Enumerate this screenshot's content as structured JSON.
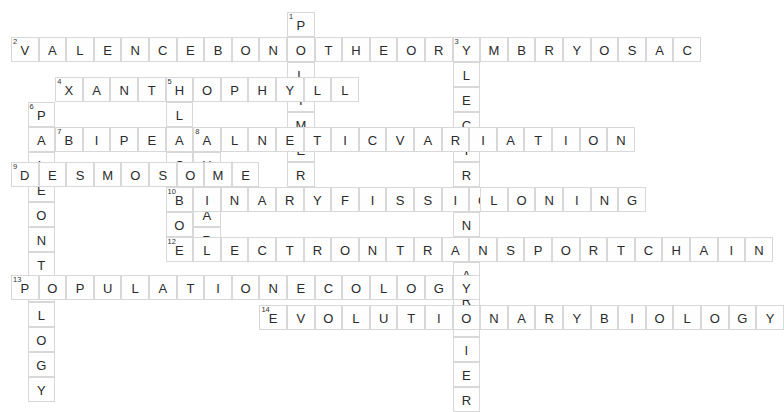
{
  "puzzle": {
    "title": "Biology Crossword Puzzle",
    "cell_size": 27.6,
    "row_height": 25.0,
    "origin_x": 11,
    "origin_y": 12,
    "colors": {
      "cell_background": "#fefefe",
      "cell_border": "#d8d8d8",
      "letter_color": "#2b2b2b",
      "number_color": "#333333",
      "page_background": "#ffffff"
    },
    "entries": [
      {
        "number": "1",
        "answer": "POLYMER",
        "direction": "down",
        "col": 10,
        "row": 0
      },
      {
        "number": "2",
        "answer": "VALENCEBONDTHEORY",
        "direction": "across",
        "col": 0,
        "row": 1
      },
      {
        "number": "3",
        "answer": "EMBRYOSAC",
        "direction": "across",
        "col": 16,
        "row": 1
      },
      {
        "number": "3",
        "answer": "ELECTRONCARRIER",
        "direction": "down",
        "col": 16,
        "row": 1
      },
      {
        "number": "4",
        "answer": "XANTHOPHYLL",
        "direction": "across",
        "col": 1.6,
        "row": 2.6
      },
      {
        "number": "5",
        "answer": "PLACEBO",
        "direction": "down",
        "col": 5.6,
        "row": 2.6
      },
      {
        "number": "6",
        "answer": "PALEONTOLOGY",
        "direction": "down",
        "col": 0.6,
        "row": 3.6
      },
      {
        "number": "7",
        "answer": "BIPEDAL",
        "direction": "across",
        "col": 1.6,
        "row": 4.6
      },
      {
        "number": "8",
        "answer": "GENETICVARIATION",
        "direction": "across",
        "col": 6.6,
        "row": 4.6
      },
      {
        "number": "8",
        "answer": "GULAR",
        "direction": "down",
        "col": 6.6,
        "row": 4.6
      },
      {
        "number": "9",
        "answer": "DESMOSOME",
        "direction": "across",
        "col": 0,
        "row": 6
      },
      {
        "number": "10",
        "answer": "BINARYFISSION",
        "direction": "across",
        "col": 5.6,
        "row": 7
      },
      {
        "number": "10",
        "answer": "BO",
        "direction": "down",
        "col": 5.6,
        "row": 7
      },
      {
        "number": "11",
        "answer": "CLONING",
        "direction": "across",
        "col": 16,
        "row": 7
      },
      {
        "number": "12",
        "answer": "ELECTRONTRANSPORTCHAIN",
        "direction": "across",
        "col": 5.6,
        "row": 9
      },
      {
        "number": "13",
        "answer": "POPULATIONECOLOGY",
        "direction": "across",
        "col": 0,
        "row": 10.5
      },
      {
        "number": "14",
        "answer": "EVOLUTIONARYBIOLOGY",
        "direction": "across",
        "col": 9,
        "row": 11.7
      }
    ],
    "cells": [
      {
        "x": 287,
        "y": 13,
        "letter": "P",
        "num": "1"
      },
      {
        "x": 287,
        "y": 38,
        "letter": "O",
        "num": ""
      },
      {
        "x": 287,
        "y": 63,
        "letter": "L",
        "num": ""
      },
      {
        "x": 287,
        "y": 88,
        "letter": "Y",
        "num": ""
      },
      {
        "x": 287,
        "y": 113,
        "letter": "M",
        "num": ""
      },
      {
        "x": 287,
        "y": 138,
        "letter": "E",
        "num": ""
      },
      {
        "x": 287,
        "y": 163,
        "letter": "R",
        "num": ""
      },
      {
        "x": 11,
        "y": 34,
        "letter": "V",
        "num": "2"
      },
      {
        "x": 38,
        "y": 34,
        "letter": "A",
        "num": ""
      },
      {
        "x": 65,
        "y": 34,
        "letter": "L",
        "num": ""
      },
      {
        "x": 92,
        "y": 34,
        "letter": "E",
        "num": ""
      },
      {
        "x": 119,
        "y": 34,
        "letter": "N",
        "num": ""
      },
      {
        "x": 146,
        "y": 34,
        "letter": "C",
        "num": ""
      },
      {
        "x": 173,
        "y": 34,
        "letter": "E",
        "num": ""
      },
      {
        "x": 200,
        "y": 34,
        "letter": "B",
        "num": ""
      },
      {
        "x": 227,
        "y": 34,
        "letter": "O",
        "num": ""
      },
      {
        "x": 254,
        "y": 34,
        "letter": "N",
        "num": ""
      },
      {
        "x": 281,
        "y": 34,
        "letter": "D",
        "num": ""
      },
      {
        "x": 308,
        "y": 34,
        "letter": "T",
        "num": ""
      },
      {
        "x": 335,
        "y": 34,
        "letter": "H",
        "num": ""
      },
      {
        "x": 362,
        "y": 34,
        "letter": "E",
        "num": ""
      },
      {
        "x": 389,
        "y": 34,
        "letter": "O",
        "num": ""
      },
      {
        "x": 416,
        "y": 34,
        "letter": "R",
        "num": ""
      },
      {
        "x": 443,
        "y": 34,
        "letter": "Y",
        "num": ""
      },
      {
        "x": 455,
        "y": 30,
        "letter": "E",
        "num": "3"
      },
      {
        "x": 482,
        "y": 30,
        "letter": "M",
        "num": ""
      },
      {
        "x": 509,
        "y": 30,
        "letter": "B",
        "num": ""
      },
      {
        "x": 536,
        "y": 30,
        "letter": "R",
        "num": ""
      },
      {
        "x": 563,
        "y": 30,
        "letter": "Y",
        "num": ""
      },
      {
        "x": 590,
        "y": 30,
        "letter": "O",
        "num": ""
      },
      {
        "x": 617,
        "y": 30,
        "letter": "S",
        "num": ""
      },
      {
        "x": 644,
        "y": 30,
        "letter": "A",
        "num": ""
      },
      {
        "x": 671,
        "y": 30,
        "letter": "C",
        "num": ""
      },
      {
        "x": 455,
        "y": 55,
        "letter": "L",
        "num": ""
      },
      {
        "x": 455,
        "y": 79,
        "letter": "E",
        "num": ""
      },
      {
        "x": 455,
        "y": 103,
        "letter": "C",
        "num": ""
      },
      {
        "x": 455,
        "y": 127,
        "letter": "T",
        "num": ""
      },
      {
        "x": 455,
        "y": 151,
        "letter": "R",
        "num": ""
      },
      {
        "x": 455,
        "y": 175,
        "letter": "O",
        "num": ""
      },
      {
        "x": 455,
        "y": 199,
        "letter": "N",
        "num": ""
      },
      {
        "x": 455,
        "y": 223,
        "letter": "C",
        "num": "11"
      },
      {
        "x": 455,
        "y": 247,
        "letter": "A",
        "num": ""
      },
      {
        "x": 455,
        "y": 271,
        "letter": "R",
        "num": ""
      },
      {
        "x": 455,
        "y": 295,
        "letter": "R",
        "num": ""
      },
      {
        "x": 455,
        "y": 319,
        "letter": "I",
        "num": ""
      },
      {
        "x": 455,
        "y": 343,
        "letter": "E",
        "num": ""
      },
      {
        "x": 455,
        "y": 367,
        "letter": "R",
        "num": ""
      },
      {
        "x": 55,
        "y": 70,
        "letter": "X",
        "num": "4"
      },
      {
        "x": 82,
        "y": 70,
        "letter": "A",
        "num": ""
      },
      {
        "x": 109,
        "y": 70,
        "letter": "N",
        "num": ""
      },
      {
        "x": 136,
        "y": 70,
        "letter": "T",
        "num": ""
      },
      {
        "x": 163,
        "y": 70,
        "letter": "H",
        "num": ""
      },
      {
        "x": 190,
        "y": 70,
        "letter": "O",
        "num": ""
      },
      {
        "x": 217,
        "y": 70,
        "letter": "P",
        "num": "5"
      },
      {
        "x": 244,
        "y": 70,
        "letter": "H",
        "num": ""
      },
      {
        "x": 271,
        "y": 70,
        "letter": "Y",
        "num": ""
      },
      {
        "x": 298,
        "y": 70,
        "letter": "L",
        "num": ""
      },
      {
        "x": 325,
        "y": 70,
        "letter": "L",
        "num": ""
      },
      {
        "x": 217,
        "y": 95,
        "letter": "L",
        "num": ""
      },
      {
        "x": 217,
        "y": 120,
        "letter": "A",
        "num": ""
      },
      {
        "x": 217,
        "y": 145,
        "letter": "C",
        "num": ""
      },
      {
        "x": 217,
        "y": 170,
        "letter": "E",
        "num": ""
      },
      {
        "x": 217,
        "y": 195,
        "letter": "B",
        "num": "10"
      },
      {
        "x": 217,
        "y": 220,
        "letter": "O",
        "num": ""
      },
      {
        "x": 28,
        "y": 96,
        "letter": "P",
        "num": "6"
      },
      {
        "x": 28,
        "y": 121,
        "letter": "A",
        "num": ""
      },
      {
        "x": 28,
        "y": 146,
        "letter": "L",
        "num": ""
      },
      {
        "x": 28,
        "y": 171,
        "letter": "E",
        "num": ""
      },
      {
        "x": 28,
        "y": 196,
        "letter": "O",
        "num": ""
      },
      {
        "x": 28,
        "y": 221,
        "letter": "N",
        "num": ""
      },
      {
        "x": 28,
        "y": 246,
        "letter": "T",
        "num": ""
      },
      {
        "x": 28,
        "y": 271,
        "letter": "O",
        "num": ""
      },
      {
        "x": 28,
        "y": 296,
        "letter": "L",
        "num": ""
      },
      {
        "x": 28,
        "y": 321,
        "letter": "O",
        "num": ""
      },
      {
        "x": 28,
        "y": 346,
        "letter": "G",
        "num": ""
      },
      {
        "x": 28,
        "y": 371,
        "letter": "Y",
        "num": ""
      },
      {
        "x": 68,
        "y": 121,
        "letter": "B",
        "num": "7"
      },
      {
        "x": 95,
        "y": 121,
        "letter": "I",
        "num": ""
      },
      {
        "x": 122,
        "y": 121,
        "letter": "P",
        "num": ""
      },
      {
        "x": 149,
        "y": 121,
        "letter": "E",
        "num": ""
      },
      {
        "x": 176,
        "y": 121,
        "letter": "D",
        "num": ""
      },
      {
        "x": 203,
        "y": 121,
        "letter": "A",
        "num": ""
      },
      {
        "x": 230,
        "y": 121,
        "letter": "L",
        "num": ""
      },
      {
        "x": 271,
        "y": 121,
        "letter": "G",
        "num": "8"
      },
      {
        "x": 298,
        "y": 121,
        "letter": "E",
        "num": ""
      },
      {
        "x": 325,
        "y": 121,
        "letter": "N",
        "num": ""
      },
      {
        "x": 352,
        "y": 121,
        "letter": "E",
        "num": ""
      },
      {
        "x": 379,
        "y": 121,
        "letter": "T",
        "num": ""
      },
      {
        "x": 406,
        "y": 121,
        "letter": "I",
        "num": ""
      },
      {
        "x": 433,
        "y": 121,
        "letter": "C",
        "num": ""
      },
      {
        "x": 460,
        "y": 121,
        "letter": "V",
        "num": ""
      },
      {
        "x": 487,
        "y": 121,
        "letter": "A",
        "num": ""
      },
      {
        "x": 514,
        "y": 121,
        "letter": "R",
        "num": ""
      },
      {
        "x": 541,
        "y": 121,
        "letter": "I",
        "num": ""
      },
      {
        "x": 568,
        "y": 121,
        "letter": "A",
        "num": ""
      },
      {
        "x": 595,
        "y": 121,
        "letter": "T",
        "num": ""
      },
      {
        "x": 622,
        "y": 121,
        "letter": "I",
        "num": ""
      },
      {
        "x": 649,
        "y": 121,
        "letter": "O",
        "num": ""
      },
      {
        "x": 676,
        "y": 121,
        "letter": "N",
        "num": ""
      },
      {
        "x": 271,
        "y": 146,
        "letter": "U",
        "num": ""
      },
      {
        "x": 271,
        "y": 171,
        "letter": "L",
        "num": ""
      },
      {
        "x": 271,
        "y": 196,
        "letter": "A",
        "num": ""
      },
      {
        "x": 271,
        "y": 221,
        "letter": "R",
        "num": ""
      },
      {
        "x": 11,
        "y": 156,
        "letter": "D",
        "num": "9"
      },
      {
        "x": 38,
        "y": 156,
        "letter": "E",
        "num": ""
      },
      {
        "x": 65,
        "y": 156,
        "letter": "S",
        "num": ""
      },
      {
        "x": 92,
        "y": 156,
        "letter": "M",
        "num": ""
      },
      {
        "x": 119,
        "y": 156,
        "letter": "O",
        "num": ""
      },
      {
        "x": 146,
        "y": 156,
        "letter": "S",
        "num": ""
      },
      {
        "x": 173,
        "y": 156,
        "letter": "O",
        "num": ""
      },
      {
        "x": 200,
        "y": 156,
        "letter": "M",
        "num": ""
      },
      {
        "x": 227,
        "y": 156,
        "letter": "E",
        "num": ""
      },
      {
        "x": 167,
        "y": 170,
        "letter": "B",
        "num": "10"
      },
      {
        "x": 194,
        "y": 170,
        "letter": "I",
        "num": ""
      },
      {
        "x": 221,
        "y": 170,
        "letter": "N",
        "num": ""
      },
      {
        "x": 248,
        "y": 170,
        "letter": "A",
        "num": ""
      },
      {
        "x": 275,
        "y": 170,
        "letter": "R",
        "num": ""
      },
      {
        "x": 302,
        "y": 170,
        "letter": "Y",
        "num": ""
      },
      {
        "x": 329,
        "y": 170,
        "letter": "F",
        "num": ""
      },
      {
        "x": 356,
        "y": 170,
        "letter": "I",
        "num": ""
      },
      {
        "x": 383,
        "y": 170,
        "letter": "S",
        "num": ""
      },
      {
        "x": 410,
        "y": 170,
        "letter": "S",
        "num": ""
      },
      {
        "x": 437,
        "y": 170,
        "letter": "I",
        "num": ""
      },
      {
        "x": 464,
        "y": 170,
        "letter": "O",
        "num": ""
      },
      {
        "x": 491,
        "y": 170,
        "letter": "N",
        "num": ""
      },
      {
        "x": 455,
        "y": 185,
        "letter": "C",
        "num": "11"
      },
      {
        "x": 482,
        "y": 185,
        "letter": "L",
        "num": ""
      },
      {
        "x": 509,
        "y": 185,
        "letter": "O",
        "num": ""
      },
      {
        "x": 536,
        "y": 185,
        "letter": "N",
        "num": ""
      },
      {
        "x": 563,
        "y": 185,
        "letter": "I",
        "num": ""
      },
      {
        "x": 590,
        "y": 185,
        "letter": "N",
        "num": ""
      },
      {
        "x": 617,
        "y": 185,
        "letter": "G",
        "num": ""
      },
      {
        "x": 167,
        "y": 226,
        "letter": "E",
        "num": "12"
      },
      {
        "x": 194,
        "y": 226,
        "letter": "L",
        "num": ""
      },
      {
        "x": 221,
        "y": 226,
        "letter": "E",
        "num": ""
      },
      {
        "x": 248,
        "y": 226,
        "letter": "C",
        "num": ""
      },
      {
        "x": 275,
        "y": 226,
        "letter": "T",
        "num": ""
      },
      {
        "x": 302,
        "y": 226,
        "letter": "R",
        "num": ""
      },
      {
        "x": 329,
        "y": 226,
        "letter": "O",
        "num": ""
      },
      {
        "x": 356,
        "y": 226,
        "letter": "N",
        "num": ""
      },
      {
        "x": 11,
        "y": 262,
        "letter": "P",
        "num": "13"
      },
      {
        "x": 38,
        "y": 262,
        "letter": "O",
        "num": ""
      },
      {
        "x": 263,
        "y": 297,
        "letter": "E",
        "num": "14"
      }
    ]
  }
}
